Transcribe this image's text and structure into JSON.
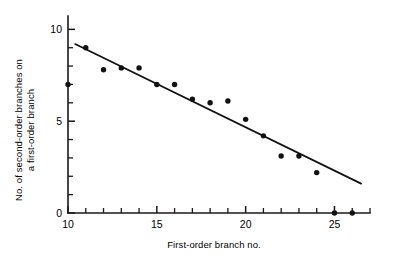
{
  "chart_data": {
    "type": "scatter",
    "title": "",
    "xlabel": "First-order branch no.",
    "ylabel": "No. of second-order branches on a first-order branch",
    "ylabel_line1": "No. of second-order branches on",
    "ylabel_line2": "a first-order branch",
    "xlim": [
      10,
      27
    ],
    "ylim": [
      0,
      10.4
    ],
    "x_major_ticks": [
      10,
      15,
      20,
      25
    ],
    "x_major_tick_labels": [
      "10",
      "15",
      "20",
      "25"
    ],
    "x_minor_ticks": [
      11,
      12,
      13,
      14,
      16,
      17,
      18,
      19,
      21,
      22,
      23,
      24,
      26,
      27
    ],
    "y_major_ticks": [
      0,
      5,
      10
    ],
    "y_major_tick_labels": [
      "0",
      "5",
      "10"
    ],
    "y_minor_ticks": [
      1,
      2,
      3,
      4,
      6,
      7,
      8,
      9
    ],
    "grid": false,
    "legend": false,
    "marker": "filled-circle",
    "marker_color": "#111111",
    "line_color": "#111111",
    "x": [
      10,
      11,
      12,
      13,
      14,
      15,
      16,
      17,
      18,
      19,
      20,
      21,
      22,
      23,
      24,
      25,
      26
    ],
    "values": [
      7.0,
      9.0,
      7.8,
      7.9,
      7.9,
      7.0,
      7.0,
      6.2,
      6.0,
      6.1,
      5.1,
      4.2,
      3.1,
      3.1,
      2.2,
      0.0,
      0.0
    ],
    "points": [
      {
        "x": 10,
        "y": 7.0
      },
      {
        "x": 11,
        "y": 9.0
      },
      {
        "x": 12,
        "y": 7.8
      },
      {
        "x": 13,
        "y": 7.9
      },
      {
        "x": 14,
        "y": 7.9
      },
      {
        "x": 15,
        "y": 7.0
      },
      {
        "x": 16,
        "y": 7.0
      },
      {
        "x": 17,
        "y": 6.2
      },
      {
        "x": 18,
        "y": 6.0
      },
      {
        "x": 19,
        "y": 6.1
      },
      {
        "x": 20,
        "y": 5.1
      },
      {
        "x": 21,
        "y": 4.2
      },
      {
        "x": 22,
        "y": 3.1
      },
      {
        "x": 23,
        "y": 3.1
      },
      {
        "x": 24,
        "y": 2.2
      },
      {
        "x": 25,
        "y": 0.0
      },
      {
        "x": 26,
        "y": 0.0
      }
    ],
    "trend_line": {
      "x_start": 10.4,
      "y_start": 9.2,
      "x_end": 26.5,
      "y_end": 1.6
    }
  }
}
